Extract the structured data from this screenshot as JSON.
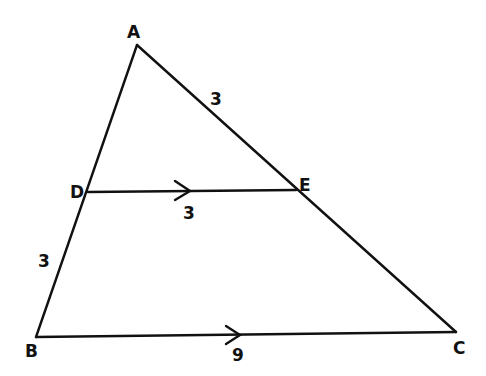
{
  "diagram": {
    "type": "triangle-with-parallel-segment",
    "vertices": [
      {
        "name": "A",
        "x": 137,
        "y": 45,
        "lx": 127,
        "ly": 38
      },
      {
        "name": "B",
        "x": 36,
        "y": 337,
        "lx": 25,
        "ly": 357
      },
      {
        "name": "C",
        "x": 456,
        "y": 332,
        "lx": 453,
        "ly": 354
      },
      {
        "name": "D",
        "x": 88,
        "y": 192,
        "lx": 70,
        "ly": 198
      },
      {
        "name": "E",
        "x": 296,
        "y": 190,
        "lx": 299,
        "ly": 191
      }
    ],
    "segments": [
      {
        "from": "A",
        "to": "B"
      },
      {
        "from": "A",
        "to": "C"
      },
      {
        "from": "B",
        "to": "C",
        "parallel_arrow": true
      },
      {
        "from": "D",
        "to": "E",
        "parallel_arrow": true
      }
    ],
    "measurements": [
      {
        "segment": "AE",
        "value": "3",
        "x": 210,
        "y": 105
      },
      {
        "segment": "DE",
        "value": "3",
        "x": 183,
        "y": 219
      },
      {
        "segment": "DB",
        "value": "3",
        "x": 38,
        "y": 267
      },
      {
        "segment": "BC",
        "value": "9",
        "x": 232,
        "y": 361
      }
    ]
  }
}
